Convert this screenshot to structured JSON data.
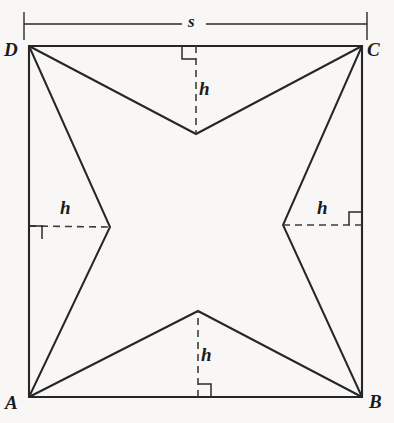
{
  "figure": {
    "background_color": "#f8f7f6",
    "stroke_color": "#222222",
    "dash_color": "#4a4a4a",
    "vertex_labels": {
      "A": "A",
      "B": "B",
      "C": "C",
      "D": "D"
    },
    "measure_labels": {
      "side": "s",
      "height_top": "h",
      "height_left": "h",
      "height_right": "h",
      "height_bottom": "h"
    },
    "geometry": {
      "square": {
        "A": [
          29,
          397
        ],
        "B": [
          362,
          397
        ],
        "C": [
          362,
          46
        ],
        "D": [
          29,
          46
        ]
      },
      "inner_vertices": {
        "top": [
          196,
          134
        ],
        "left": [
          110,
          227
        ],
        "right": [
          283,
          225
        ],
        "bottom": [
          198,
          311
        ]
      },
      "altitudes": [
        {
          "name": "top",
          "from": [
            196,
            46
          ],
          "to": [
            196,
            134
          ]
        },
        {
          "name": "left",
          "from": [
            29,
            226
          ],
          "to": [
            110,
            227
          ]
        },
        {
          "name": "right",
          "from": [
            362,
            225
          ],
          "to": [
            283,
            225
          ]
        },
        {
          "name": "bottom",
          "from": [
            198,
            397
          ],
          "to": [
            198,
            311
          ]
        }
      ],
      "dimension_line": {
        "y": 24,
        "x_start": 24,
        "x_end": 367,
        "tick_top": 12,
        "tick_bottom": 40
      }
    }
  }
}
